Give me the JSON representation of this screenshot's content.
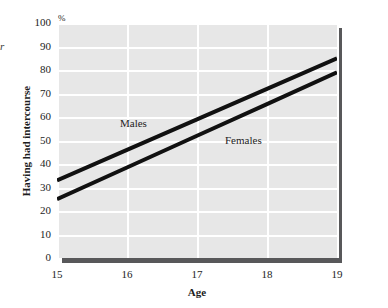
{
  "chart_data": {
    "type": "line",
    "title": "",
    "xlabel": "Age",
    "ylabel": "Having had intercourse",
    "unit_label": "%",
    "x": [
      15,
      16,
      17,
      18,
      19
    ],
    "xlim": [
      15,
      19
    ],
    "ylim": [
      0,
      100
    ],
    "xticks": [
      "15",
      "16",
      "17",
      "18",
      "19"
    ],
    "yticks": [
      "0",
      "10",
      "20",
      "30",
      "40",
      "50",
      "60",
      "70",
      "80",
      "90",
      "100"
    ],
    "grid": true,
    "legend_position": "inline-annotations",
    "series": [
      {
        "name": "Males",
        "values": [
          33,
          46,
          59,
          72,
          85
        ]
      },
      {
        "name": "Females",
        "values": [
          25,
          38.5,
          52,
          65.5,
          79
        ]
      }
    ],
    "annotations": [
      {
        "text": "Males",
        "x": 15.9,
        "y": 57
      },
      {
        "text": "Females",
        "x": 17.4,
        "y": 50
      }
    ]
  },
  "figure": {
    "cropped_caption_fragment": "r",
    "panel_color": "#e7e7e7",
    "gridline_color": "#ffffff",
    "shadow_color": "#58585a",
    "series_color": "#111111",
    "text_color": "#1d1d1d"
  }
}
